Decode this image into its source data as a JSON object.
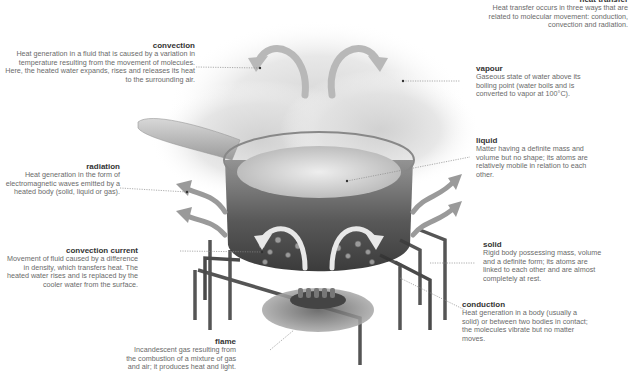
{
  "heat_transfer": {
    "title": "heat transfer",
    "text": "Heat transfer occurs in three ways that are related to molecular movement: conduction, convection and radiation."
  },
  "labels": {
    "convection": {
      "title": "convection",
      "text": "Heat generation in a fluid that is caused by a variation in temperature resulting from the movement of molecules. Here, the heated water expands, rises and releases its heat to the surrounding air."
    },
    "vapour": {
      "title": "vapour",
      "text": "Gaseous state of water above its boiling point (water boils and is converted to vapor at 100°C)."
    },
    "liquid": {
      "title": "liquid",
      "text": "Matter having a definite mass and volume but no shape; its atoms are relatively mobile in relation to each other."
    },
    "radiation": {
      "title": "radiation",
      "text": "Heat generation in the form of electromagnetic waves emitted by a heated body (solid, liquid or gas)."
    },
    "convection_current": {
      "title": "convection current",
      "text": "Movement of fluid caused by a difference in density, which transfers heat. The heated water rises and is replaced by the cooler water from the surface."
    },
    "solid": {
      "title": "solid",
      "text": "Rigid body possessing mass, volume and a definite form; its atoms are linked to each other and are almost completely at rest."
    },
    "conduction": {
      "title": "conduction",
      "text": "Heat generation in a body (usually a solid) or between two bodies in contact; the molecules vibrate but no matter moves."
    },
    "flame": {
      "title": "flame",
      "text": "Incandescent gas resulting from the combustion of a mixture of gas and air; it produces heat and light."
    }
  },
  "colors": {
    "arrow": "#9a9a9a",
    "pot_dark": "#3c3c3c",
    "steam": "#d9d9d9",
    "leader": "#8a8a8a",
    "title": "#333333",
    "body_text": "#6a6a6a"
  }
}
